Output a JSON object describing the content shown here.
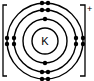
{
  "diagram": {
    "type": "electron-shell-diagram",
    "element_symbol": "K",
    "ion_charge": "+",
    "shells": [
      {
        "index": 1,
        "electrons": 2
      },
      {
        "index": 2,
        "electrons": 8
      },
      {
        "index": 3,
        "electrons": 8
      }
    ],
    "colors": {
      "line": "#000000",
      "background": "#ffffff"
    }
  }
}
